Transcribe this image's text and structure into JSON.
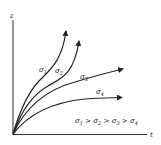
{
  "diagram": {
    "y_axis_label": "ε",
    "x_axis_label": "t",
    "curves": [
      {
        "id": "sigma1",
        "symbol": "σ",
        "sub": "1"
      },
      {
        "id": "sigma2",
        "symbol": "σ",
        "sub": "2"
      },
      {
        "id": "sigma3",
        "symbol": "σ",
        "sub": "3"
      },
      {
        "id": "sigma4",
        "symbol": "σ",
        "sub": "4"
      }
    ],
    "relation": {
      "s1": "σ",
      "sub1": "1",
      "gt1": ">",
      "s2": "σ",
      "sub2": "2",
      "gt2": ">",
      "s3": "σ",
      "sub3": "3",
      "gt3": ">",
      "s4": "σ",
      "sub4": "4"
    },
    "colors": {
      "line": "#222222",
      "background": "#ffffff"
    }
  }
}
